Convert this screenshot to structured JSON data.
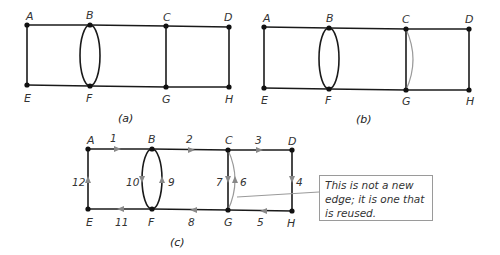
{
  "diagrams": [
    {
      "id": "a",
      "caption": "(a)",
      "vertices": [
        {
          "name": "A",
          "label": "A"
        },
        {
          "name": "B",
          "label": "B"
        },
        {
          "name": "C",
          "label": "C"
        },
        {
          "name": "D",
          "label": "D"
        },
        {
          "name": "E",
          "label": "E"
        },
        {
          "name": "F",
          "label": "F"
        },
        {
          "name": "G",
          "label": "G"
        },
        {
          "name": "H",
          "label": "H"
        }
      ]
    },
    {
      "id": "b",
      "caption": "(b)",
      "vertices": [
        {
          "name": "A",
          "label": "A"
        },
        {
          "name": "B",
          "label": "B"
        },
        {
          "name": "C",
          "label": "C"
        },
        {
          "name": "D",
          "label": "D"
        },
        {
          "name": "E",
          "label": "E"
        },
        {
          "name": "F",
          "label": "F"
        },
        {
          "name": "G",
          "label": "G"
        },
        {
          "name": "H",
          "label": "H"
        }
      ]
    },
    {
      "id": "c",
      "caption": "(c)",
      "vertices": [
        {
          "name": "A",
          "label": "A"
        },
        {
          "name": "B",
          "label": "B"
        },
        {
          "name": "C",
          "label": "C"
        },
        {
          "name": "D",
          "label": "D"
        },
        {
          "name": "E",
          "label": "E"
        },
        {
          "name": "F",
          "label": "F"
        },
        {
          "name": "G",
          "label": "G"
        },
        {
          "name": "H",
          "label": "H"
        }
      ],
      "edge_order": [
        {
          "n": "1",
          "from": "A",
          "to": "B"
        },
        {
          "n": "2",
          "from": "B",
          "to": "C"
        },
        {
          "n": "3",
          "from": "C",
          "to": "D"
        },
        {
          "n": "4",
          "from": "D",
          "to": "H"
        },
        {
          "n": "5",
          "from": "H",
          "to": "G"
        },
        {
          "n": "6",
          "from": "G",
          "to": "C"
        },
        {
          "n": "7",
          "from": "C",
          "to": "G"
        },
        {
          "n": "8",
          "from": "G",
          "to": "F"
        },
        {
          "n": "9",
          "from": "F",
          "to": "B"
        },
        {
          "n": "10",
          "from": "B",
          "to": "F"
        },
        {
          "n": "11",
          "from": "F",
          "to": "E"
        },
        {
          "n": "12",
          "from": "E",
          "to": "A"
        }
      ],
      "callout": "This is not a new edge; it is one that is reused."
    }
  ],
  "colors": {
    "edge": "#1a1a1a",
    "reused_edge": "#9a9a9a",
    "arrow": "#888888",
    "vertex": "#111111"
  }
}
